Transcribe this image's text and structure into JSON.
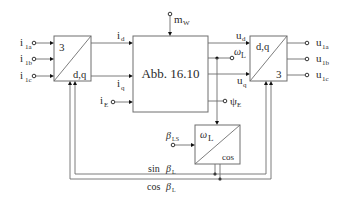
{
  "blocks": {
    "left_transform": {
      "top": "3",
      "bottom": "d,q"
    },
    "center": {
      "label": "Abb. 16.10"
    },
    "right_transform": {
      "top": "d,q",
      "bottom": "3"
    },
    "omega_block": {
      "top": "ω",
      "top_sub": "L",
      "bottom": "cos"
    }
  },
  "inputs": {
    "i1a": {
      "main": "i",
      "sub": "1a"
    },
    "i1b": {
      "main": "i",
      "sub": "1b"
    },
    "i1c": {
      "main": "i",
      "sub": "1c"
    },
    "iE": {
      "main": "i",
      "sub": "E"
    },
    "mW": {
      "main": "m",
      "sub": "W"
    },
    "betaLS": {
      "main": "β",
      "sub": "LS"
    }
  },
  "signals": {
    "id": {
      "main": "i",
      "sub": "d"
    },
    "iq": {
      "main": "i",
      "sub": "q"
    },
    "ud": {
      "main": "u",
      "sub": "d"
    },
    "uq": {
      "main": "u",
      "sub": "q"
    },
    "omegaL": {
      "main": "ω",
      "sub": "L"
    },
    "psiE": {
      "main": "ψ",
      "sub": "E"
    },
    "sin": {
      "pre": "sin ",
      "main": "β",
      "sub": "L"
    },
    "cos": {
      "pre": "cos ",
      "main": "β",
      "sub": "L"
    }
  },
  "outputs": {
    "u1a": {
      "main": "u",
      "sub": "1a"
    },
    "u1b": {
      "main": "u",
      "sub": "1b"
    },
    "u1c": {
      "main": "u",
      "sub": "1c"
    }
  }
}
